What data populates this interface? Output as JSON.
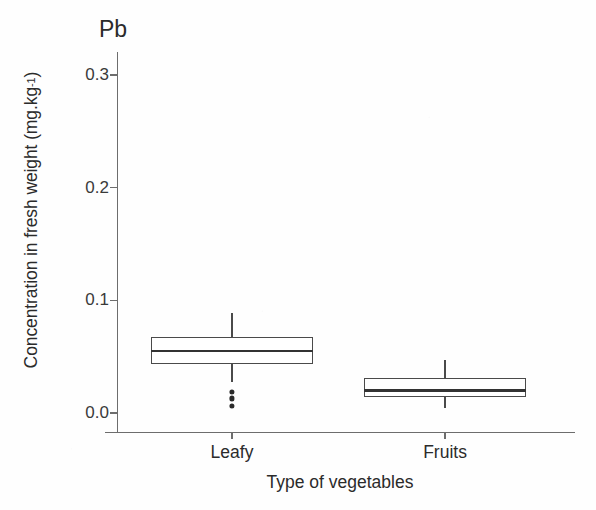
{
  "chart_data": {
    "type": "box",
    "title": "",
    "panel_tag": "Pb",
    "xlabel": "Type of vegetables",
    "ylabel": "Concentration in fresh weight (mg.kg",
    "ylabel_sup": "-1",
    "ylabel_close": ")",
    "categories": [
      "Leafy",
      "Fruits"
    ],
    "ylim": [
      0.0,
      0.33
    ],
    "yticks": [
      0.0,
      0.1,
      0.2,
      0.3
    ],
    "ytick_labels": [
      "0.0",
      "0.1",
      "0.2",
      "0.3"
    ],
    "grid": false,
    "legend": "none",
    "series": [
      {
        "name": "Leafy",
        "whisker_low": 0.0275,
        "q1": 0.0435,
        "median": 0.055,
        "q3": 0.0675,
        "whisker_high": 0.089,
        "outliers": [
          0.019,
          0.013,
          0.006
        ]
      },
      {
        "name": "Fruits",
        "whisker_low": 0.004,
        "q1": 0.014,
        "median": 0.02,
        "q3": 0.031,
        "whisker_high": 0.047,
        "outliers": []
      }
    ],
    "colors": {
      "box_stroke": "#4a4a4a",
      "median": "#333333",
      "box_fill": "#ffffff",
      "axis": "#6d6d6d",
      "text": "#2b2b2b",
      "outlier": "#2a2a2a"
    }
  },
  "geometry": {
    "plot_left": 117,
    "plot_right": 575,
    "plot_top": 52,
    "plot_bottom": 432,
    "y_zero_px": 413,
    "y_per_unit_px": 1127,
    "box_half_width": 81,
    "centers_px": [
      232,
      445
    ]
  }
}
